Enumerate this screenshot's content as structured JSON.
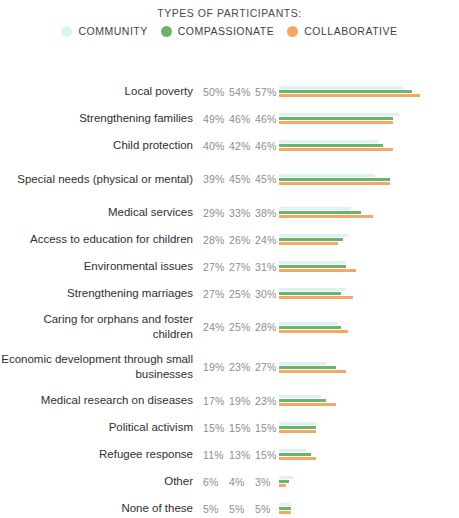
{
  "legend": {
    "title": "TYPES OF PARTICIPANTS:",
    "items": [
      {
        "label": "COMMUNITY",
        "color": "#ddf3ef",
        "icon": "legend-dot-icon"
      },
      {
        "label": "COMPASSIONATE",
        "color": "#6cb46e",
        "icon": "legend-dot-icon"
      },
      {
        "label": "COLLABORATIVE",
        "color": "#f5a863",
        "icon": "legend-dot-icon"
      }
    ]
  },
  "chart_data": {
    "type": "bar",
    "orientation": "horizontal",
    "title": "TYPES OF PARTICIPANTS:",
    "xlabel": "",
    "ylabel": "",
    "xlim": [
      0,
      60
    ],
    "grid": false,
    "legend_position": "top-center",
    "value_suffix": "%",
    "px_per_percent": 2.47,
    "categories": [
      "Local poverty",
      "Strengthening families",
      "Child protection",
      "Special needs (physical or mental)",
      "Medical services",
      "Access to education for children",
      "Environmental issues",
      "Strengthening marriages",
      "Caring for orphans and foster children",
      "Economic development through small businesses",
      "Medical research on diseases",
      "Political activism",
      "Refugee response",
      "Other",
      "None of these"
    ],
    "series": [
      {
        "name": "COMMUNITY",
        "color": "#ddf3ef",
        "values": [
          50,
          49,
          40,
          39,
          29,
          28,
          27,
          27,
          24,
          19,
          17,
          15,
          11,
          6,
          5
        ],
        "labels": [
          "50%",
          "49%",
          "40%",
          "39%",
          "29%",
          "28%",
          "27%",
          "27%",
          "24%",
          "19%",
          "17%",
          "15%",
          "11%",
          "6%",
          "5%"
        ]
      },
      {
        "name": "COMPASSIONATE",
        "color": "#6cb46e",
        "values": [
          54,
          46,
          42,
          45,
          33,
          26,
          27,
          25,
          25,
          23,
          19,
          15,
          13,
          4,
          5
        ],
        "labels": [
          "54%",
          "46%",
          "42%",
          "45%",
          "33%",
          "26%",
          "27%",
          "25%",
          "25%",
          "23%",
          "19%",
          "15%",
          "13%",
          "4%",
          "5%"
        ]
      },
      {
        "name": "COLLABORATIVE",
        "color": "#f5a863",
        "values": [
          57,
          46,
          46,
          45,
          38,
          24,
          31,
          30,
          28,
          27,
          23,
          15,
          15,
          3,
          5
        ],
        "labels": [
          "57%",
          "46%",
          "46%",
          "45%",
          "38%",
          "24%",
          "31%",
          "30%",
          "28%",
          "27%",
          "23%",
          "15%",
          "15%",
          "3%",
          "5%"
        ]
      }
    ]
  }
}
